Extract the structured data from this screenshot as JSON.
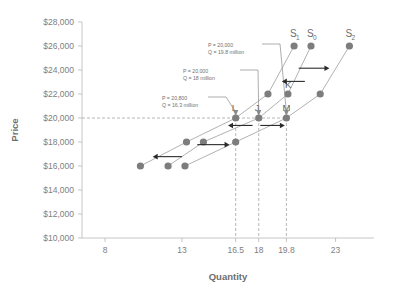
{
  "chart_data": {
    "type": "line",
    "title": "",
    "xlabel": "Quantity",
    "ylabel": "Price",
    "xlim": [
      6.5,
      25.5
    ],
    "ylim": [
      10000,
      28000
    ],
    "grid": false,
    "legend_position": "inline-curve-labels",
    "xticks": [
      "8",
      "13",
      "16.5",
      "18",
      "19.8",
      "23"
    ],
    "xtick_values": [
      8,
      13,
      16.5,
      18,
      19.8,
      23
    ],
    "yticks": [
      "$10,000",
      "$12,000",
      "$14,000",
      "$16,000",
      "$18,000",
      "$20,000",
      "$22,000",
      "$24,000",
      "$26,000",
      "$28,000"
    ],
    "ytick_values": [
      10000,
      12000,
      14000,
      16000,
      18000,
      20000,
      22000,
      24000,
      26000,
      28000
    ],
    "series": [
      {
        "name": "S1",
        "label": "S",
        "subscript": "1",
        "x": [
          10.3,
          13.3,
          16.5,
          18.6,
          20.3
        ],
        "values": [
          16000,
          18000,
          20000,
          22000,
          26000
        ]
      },
      {
        "name": "S0",
        "label": "S",
        "subscript": "0",
        "x": [
          12.1,
          14.4,
          18.0,
          19.9,
          21.4
        ],
        "values": [
          16000,
          18000,
          20000,
          22000,
          26000
        ]
      },
      {
        "name": "S2",
        "label": "S",
        "subscript": "2",
        "x": [
          13.2,
          16.5,
          19.8,
          22.0,
          23.9
        ],
        "values": [
          16000,
          18000,
          20000,
          22000,
          26000
        ]
      }
    ],
    "point_labels": [
      {
        "text": "L",
        "x": 16.5,
        "y": 20000
      },
      {
        "text": "J",
        "x": 18.0,
        "y": 20000
      },
      {
        "text": "K",
        "x": 19.9,
        "y": 22000
      },
      {
        "text": "M",
        "x": 19.8,
        "y": 20000
      }
    ],
    "annotations": [
      {
        "id": "anno-top",
        "line1": "P = 20,000",
        "line2": "Q = 19.8 million",
        "target_x": 19.8,
        "target_y": 20000
      },
      {
        "id": "anno-mid",
        "line1": "P = 20,000",
        "line2": "Q = 18 million",
        "target_x": 18.0,
        "target_y": 20000
      },
      {
        "id": "anno-bottom",
        "line1": "P = 20,800",
        "line2": "Q = 16.3 million",
        "target_x": 16.5,
        "target_y": 20000
      }
    ],
    "reference_lines": [
      {
        "orientation": "horizontal",
        "value": 20000,
        "style": "dashed"
      },
      {
        "orientation": "vertical",
        "value": 16.5,
        "style": "dashed"
      },
      {
        "orientation": "vertical",
        "value": 18.0,
        "style": "dashed"
      },
      {
        "orientation": "vertical",
        "value": 19.8,
        "style": "dashed"
      }
    ],
    "shift_arrows": [
      {
        "direction": "left",
        "note": "leftward supply shift at $16,000"
      },
      {
        "direction": "right",
        "note": "rightward supply shift at $18,000"
      },
      {
        "direction": "left",
        "note": "leftward supply shift at $20,000"
      },
      {
        "direction": "right",
        "note": "rightward supply shift at $20,000"
      },
      {
        "direction": "left",
        "note": "leftward supply shift at $23,000"
      },
      {
        "direction": "right",
        "note": "rightward supply shift at $24,000"
      }
    ],
    "colors": {
      "marker": "#7d7d7d",
      "curve": "#a8a8a8",
      "axis": "#b8b8b8",
      "text": "#6e6e6e",
      "arrow": "#2b2b2b",
      "background": "#ffffff"
    }
  }
}
